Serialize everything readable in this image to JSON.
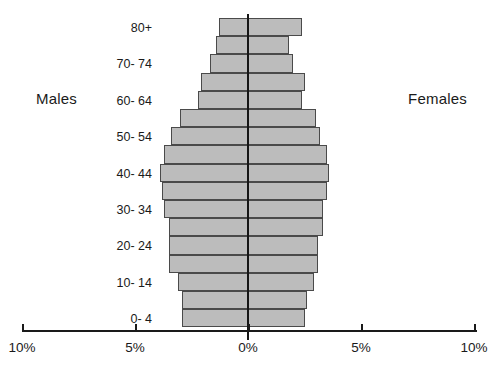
{
  "labels": {
    "males": "Males",
    "females": "Females"
  },
  "chart_data": {
    "type": "bar",
    "subtype": "population-pyramid",
    "title": "",
    "xlabel": "",
    "ylabel": "",
    "orientation": "horizontal-diverging",
    "grid": false,
    "legend": [
      "Males",
      "Females"
    ],
    "legend_position": "sides",
    "xlim": [
      -10,
      10
    ],
    "xunit": "%",
    "xticks": [
      -10,
      -5,
      0,
      5,
      10
    ],
    "xticklabels": [
      "10%",
      "5%",
      "0%",
      "5%",
      "10%"
    ],
    "categories": [
      "0- 4",
      "5- 9",
      "10- 14",
      "15- 19",
      "20- 24",
      "25- 29",
      "30- 34",
      "35- 39",
      "40- 44",
      "45- 49",
      "50- 54",
      "55- 59",
      "60- 64",
      "65- 69",
      "70- 74",
      "75- 79",
      "80+"
    ],
    "ytick_visible": [
      "0- 4",
      "10- 14",
      "20- 24",
      "30- 34",
      "40- 44",
      "50- 54",
      "60- 64",
      "70- 74",
      "80+"
    ],
    "series": [
      {
        "name": "Males",
        "side": "left",
        "values": [
          2.9,
          2.9,
          3.1,
          3.5,
          3.5,
          3.5,
          3.7,
          3.8,
          3.9,
          3.7,
          3.4,
          3.0,
          2.2,
          2.1,
          1.7,
          1.4,
          1.3
        ]
      },
      {
        "name": "Females",
        "side": "right",
        "values": [
          2.5,
          2.6,
          2.9,
          3.1,
          3.1,
          3.3,
          3.3,
          3.5,
          3.6,
          3.5,
          3.2,
          3.0,
          2.4,
          2.5,
          2.0,
          1.8,
          2.4
        ]
      }
    ]
  }
}
